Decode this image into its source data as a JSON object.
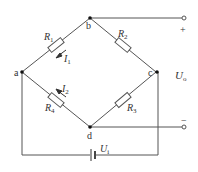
{
  "diagram": {
    "type": "wheatstone-bridge-circuit",
    "nodes": {
      "a": "a",
      "b": "b",
      "c": "c",
      "d": "d"
    },
    "resistors": [
      {
        "id": "R1",
        "base": "R",
        "sub": "1",
        "between": "a-b"
      },
      {
        "id": "R2",
        "base": "R",
        "sub": "2",
        "between": "b-c"
      },
      {
        "id": "R3",
        "base": "R",
        "sub": "3",
        "between": "c-d"
      },
      {
        "id": "R4",
        "base": "R",
        "sub": "4",
        "between": "a-d"
      }
    ],
    "currents": [
      {
        "id": "I1",
        "base": "I",
        "sub": "1",
        "branch": "R1"
      },
      {
        "id": "I2",
        "base": "I",
        "sub": "2",
        "branch": "R4"
      }
    ],
    "output": {
      "label_base": "U",
      "label_sub": "o",
      "plus": "+",
      "minus": "−"
    },
    "source": {
      "label_base": "U",
      "label_sub": "i"
    },
    "colors": {
      "wire": "#555555",
      "text": "#333333",
      "node": "#111111"
    }
  }
}
